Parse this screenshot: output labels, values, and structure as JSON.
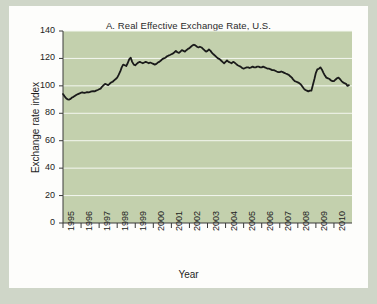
{
  "figure": {
    "panel_label": "A.",
    "background_color": "#cfd6c8",
    "card_color": "#fdfdfb"
  },
  "chart_data": {
    "type": "line",
    "title": "A. Real Effective Exchange Rate, U.S.",
    "xlabel": "Year",
    "ylabel": "Exchange rate index",
    "xlim": [
      1995,
      2011
    ],
    "ylim": [
      0,
      140
    ],
    "ytick_labels": [
      "0",
      "20",
      "40",
      "60",
      "80",
      "100",
      "120",
      "140"
    ],
    "yticks": [
      0,
      20,
      40,
      60,
      80,
      100,
      120,
      140
    ],
    "xtick_labels": [
      "1995",
      "1996",
      "1997",
      "1998",
      "1999",
      "2000",
      "2001",
      "2002",
      "2003",
      "2004",
      "2005",
      "2006",
      "2007",
      "2008",
      "2009",
      "2010"
    ],
    "xticks": [
      1995,
      1996,
      1997,
      1998,
      1999,
      2000,
      2001,
      2002,
      2003,
      2004,
      2005,
      2006,
      2007,
      2008,
      2009,
      2010
    ],
    "grid": "horizontal",
    "grid_color": "#f4f7f0",
    "plot_background": "#c3d0ad",
    "line_color": "#1a1a1a",
    "line_width": 1.8,
    "legend": null,
    "series": [
      {
        "name": "Real effective exchange rate index, U.S.",
        "x": [
          1995.0,
          1995.08,
          1995.17,
          1995.25,
          1995.33,
          1995.42,
          1995.5,
          1995.58,
          1995.67,
          1995.75,
          1995.83,
          1995.92,
          1996.0,
          1996.08,
          1996.17,
          1996.25,
          1996.33,
          1996.42,
          1996.5,
          1996.58,
          1996.67,
          1996.75,
          1996.83,
          1996.92,
          1997.0,
          1997.08,
          1997.17,
          1997.25,
          1997.33,
          1997.42,
          1997.5,
          1997.58,
          1997.67,
          1997.75,
          1997.83,
          1997.92,
          1998.0,
          1998.08,
          1998.17,
          1998.25,
          1998.33,
          1998.42,
          1998.5,
          1998.58,
          1998.67,
          1998.75,
          1998.83,
          1998.92,
          1999.0,
          1999.08,
          1999.17,
          1999.25,
          1999.33,
          1999.42,
          1999.5,
          1999.58,
          1999.67,
          1999.75,
          1999.83,
          1999.92,
          2000.0,
          2000.08,
          2000.17,
          2000.25,
          2000.33,
          2000.42,
          2000.5,
          2000.58,
          2000.67,
          2000.75,
          2000.83,
          2000.92,
          2001.0,
          2001.08,
          2001.17,
          2001.25,
          2001.33,
          2001.42,
          2001.5,
          2001.58,
          2001.67,
          2001.75,
          2001.83,
          2001.92,
          2002.0,
          2002.08,
          2002.17,
          2002.25,
          2002.33,
          2002.42,
          2002.5,
          2002.58,
          2002.67,
          2002.75,
          2002.83,
          2002.92,
          2003.0,
          2003.08,
          2003.17,
          2003.25,
          2003.33,
          2003.42,
          2003.5,
          2003.58,
          2003.67,
          2003.75,
          2003.83,
          2003.92,
          2004.0,
          2004.08,
          2004.17,
          2004.25,
          2004.33,
          2004.42,
          2004.5,
          2004.58,
          2004.67,
          2004.75,
          2004.83,
          2004.92,
          2005.0,
          2005.08,
          2005.17,
          2005.25,
          2005.33,
          2005.42,
          2005.5,
          2005.58,
          2005.67,
          2005.75,
          2005.83,
          2005.92,
          2006.0,
          2006.08,
          2006.17,
          2006.25,
          2006.33,
          2006.42,
          2006.5,
          2006.58,
          2006.67,
          2006.75,
          2006.83,
          2006.92,
          2007.0,
          2007.08,
          2007.17,
          2007.25,
          2007.33,
          2007.42,
          2007.5,
          2007.58,
          2007.67,
          2007.75,
          2007.83,
          2007.92,
          2008.0,
          2008.08,
          2008.17,
          2008.25,
          2008.33,
          2008.42,
          2008.5,
          2008.58,
          2008.67,
          2008.75,
          2008.83,
          2008.92,
          2009.0,
          2009.08,
          2009.17,
          2009.25,
          2009.33,
          2009.42,
          2009.5,
          2009.58,
          2009.67,
          2009.75,
          2009.83,
          2009.92,
          2010.0,
          2010.08,
          2010.17,
          2010.25,
          2010.33,
          2010.42,
          2010.5,
          2010.58,
          2010.67,
          2010.75,
          2010.83
        ],
        "y": [
          94.0,
          92.5,
          91.0,
          90.2,
          90.0,
          90.5,
          91.5,
          92.0,
          92.8,
          93.5,
          94.0,
          94.5,
          95.0,
          95.2,
          94.8,
          95.0,
          95.5,
          95.3,
          95.6,
          96.0,
          96.2,
          96.0,
          96.5,
          97.0,
          97.5,
          98.0,
          99.5,
          100.5,
          101.5,
          101.0,
          100.5,
          101.5,
          102.5,
          103.0,
          104.0,
          105.0,
          106.0,
          108.0,
          110.5,
          113.5,
          115.5,
          115.0,
          114.5,
          116.5,
          119.5,
          120.5,
          117.5,
          115.5,
          115.0,
          116.0,
          117.0,
          117.5,
          117.0,
          116.5,
          117.0,
          117.5,
          117.0,
          116.5,
          117.0,
          116.5,
          116.0,
          115.5,
          116.0,
          117.0,
          117.5,
          118.5,
          119.5,
          120.0,
          120.5,
          121.5,
          122.0,
          122.5,
          123.0,
          123.5,
          124.5,
          125.5,
          124.5,
          124.0,
          125.0,
          126.0,
          125.5,
          125.0,
          126.0,
          127.0,
          127.5,
          128.5,
          129.5,
          130.0,
          129.5,
          128.5,
          128.0,
          128.5,
          128.0,
          127.0,
          126.0,
          125.0,
          125.5,
          126.5,
          125.5,
          124.0,
          123.0,
          122.0,
          121.0,
          120.0,
          119.5,
          118.5,
          117.5,
          116.5,
          117.5,
          118.5,
          117.5,
          117.0,
          116.5,
          117.5,
          117.0,
          116.0,
          115.0,
          114.5,
          114.0,
          113.0,
          112.5,
          113.0,
          113.5,
          113.5,
          113.0,
          113.5,
          114.0,
          113.5,
          113.5,
          114.0,
          114.0,
          113.5,
          113.5,
          114.0,
          113.5,
          113.0,
          112.5,
          112.5,
          112.0,
          111.5,
          111.5,
          111.0,
          110.5,
          110.0,
          110.0,
          110.5,
          110.0,
          109.5,
          109.0,
          108.5,
          108.0,
          107.0,
          106.0,
          104.5,
          103.5,
          103.0,
          102.5,
          102.0,
          101.0,
          99.5,
          98.0,
          97.0,
          96.5,
          96.0,
          96.5,
          96.5,
          100.5,
          105.0,
          109.5,
          112.0,
          112.5,
          113.5,
          112.0,
          109.5,
          107.5,
          106.0,
          105.5,
          105.0,
          104.0,
          103.5,
          103.5,
          104.5,
          105.5,
          106.0,
          105.0,
          103.5,
          102.5,
          102.0,
          101.5,
          100.0,
          100.5
        ]
      }
    ]
  }
}
